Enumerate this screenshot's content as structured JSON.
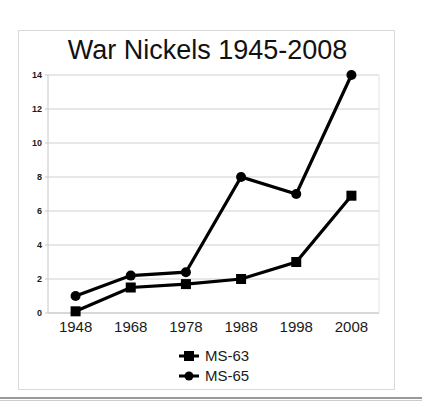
{
  "chart_data": {
    "type": "line",
    "title": "War Nickels 1945-2008",
    "xlabel": "",
    "ylabel": "",
    "categories": [
      "1948",
      "1968",
      "1978",
      "1988",
      "1998",
      "2008"
    ],
    "series": [
      {
        "name": "MS-63",
        "marker": "square",
        "color": "#000000",
        "values": [
          0.1,
          1.5,
          1.7,
          2.0,
          3.0,
          6.9
        ]
      },
      {
        "name": "MS-65",
        "marker": "circle",
        "color": "#000000",
        "values": [
          1.0,
          2.2,
          2.4,
          8.0,
          7.0,
          14.0
        ]
      }
    ],
    "ylim": [
      0,
      14
    ],
    "yticks": [
      0,
      2,
      4,
      6,
      8,
      10,
      12,
      14
    ],
    "ytick_labels": [
      "0",
      "2",
      "4",
      "6",
      "8",
      "10",
      "12",
      "14"
    ],
    "grid": "horizontal",
    "legend_position": "bottom-center",
    "legend_entries": [
      "MS-63",
      "MS-65"
    ],
    "gridline_color": "#d0d0d0",
    "axis_color": "#c8c8c8",
    "line_color": "#000000"
  },
  "frame": {
    "border_color": "#d9d9d9",
    "background": "#ffffff"
  }
}
